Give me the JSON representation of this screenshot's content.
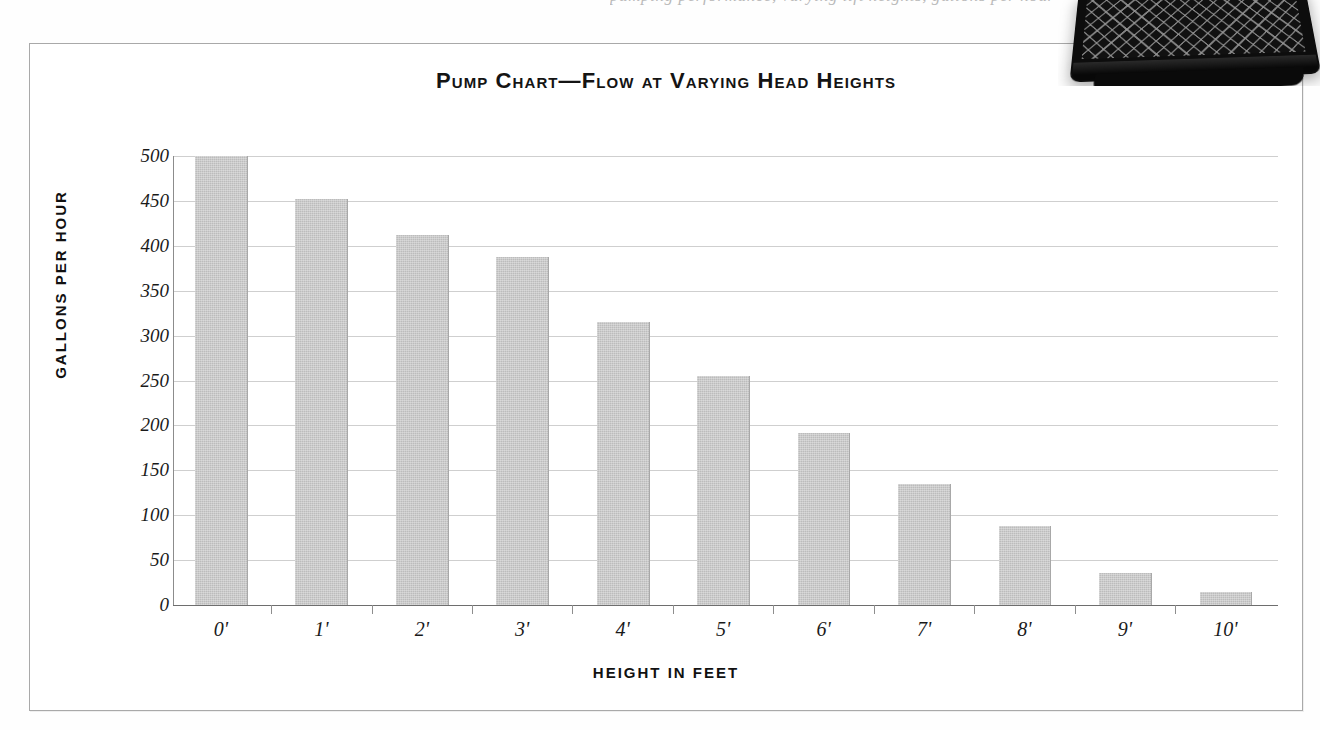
{
  "page": {
    "clipped_caption_text": "pumping performance, varying lift heights, gallons per hour",
    "photo_label": "black-mesh-crate-photo"
  },
  "chart": {
    "title": "Pump Chart—Flow at Varying Head Heights",
    "xlabel": "HEIGHT IN FEET",
    "ylabel": "GALLONS PER HOUR"
  },
  "chart_data": {
    "type": "bar",
    "title": "Pump Chart—Flow at Varying Head Heights",
    "xlabel": "HEIGHT IN FEET",
    "ylabel": "GALLONS PER HOUR",
    "categories": [
      "0'",
      "1'",
      "2'",
      "3'",
      "4'",
      "5'",
      "6'",
      "7'",
      "8'",
      "9'",
      "10'"
    ],
    "values": [
      500,
      452,
      412,
      388,
      315,
      255,
      192,
      135,
      88,
      36,
      15
    ],
    "ylim": [
      0,
      500
    ],
    "ytick_values": [
      0,
      50,
      100,
      150,
      200,
      250,
      300,
      350,
      400,
      450,
      500
    ],
    "ytick_labels": [
      "0",
      "50",
      "100",
      "150",
      "200",
      "250",
      "300",
      "350",
      "400",
      "450",
      "500"
    ],
    "grid": true,
    "legend": false,
    "bar_color": "#bcbcbc",
    "grid_color": "#cfcfcf",
    "axis_color": "#8c8c8c",
    "text_color": "#1a1a1a"
  }
}
